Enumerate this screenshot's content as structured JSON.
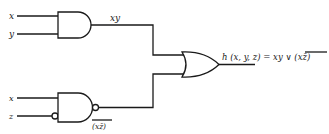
{
  "diagram": {
    "type": "logic-circuit",
    "inputs_top": {
      "a": "x",
      "b": "y"
    },
    "inputs_bottom": {
      "a": "x",
      "b": "z"
    },
    "and_output_label": "xy",
    "nand_output_label": "(xz̄)",
    "output_label": "h (x, y, z) = xy ∨ ",
    "output_label_overlined": "(xz̄)",
    "gates": [
      {
        "id": "and-gate",
        "kind": "AND",
        "inputs": [
          "x",
          "y"
        ],
        "output": "xy"
      },
      {
        "id": "nand-gate",
        "kind": "NAND",
        "inputs": [
          "x",
          "z̄ (inverted input)"
        ],
        "output": "(xz̄)‾"
      },
      {
        "id": "or-gate",
        "kind": "OR",
        "inputs": [
          "xy",
          "(xz̄)‾"
        ],
        "output": "h(x, y, z)"
      }
    ],
    "colors": {
      "ink": "#1a1a1a",
      "background": "#ffffff"
    }
  }
}
